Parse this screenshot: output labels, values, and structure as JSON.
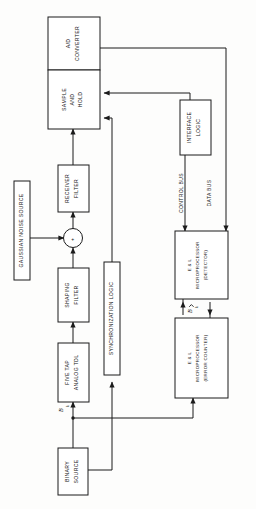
{
  "diagram": {
    "orientation": "rotated-90-ccw",
    "colors": {
      "stroke": "#1b1b1b",
      "background": "#fdfdfc",
      "block_fill": "#ffffff"
    },
    "blocks": [
      {
        "id": "ad_converter",
        "label": "A/D\nCONVERTER"
      },
      {
        "id": "sample_and_hold",
        "label": "SAMPLE\nAND\nHOLD"
      },
      {
        "id": "receiver_filter",
        "label": "RECEIVER\nFILTER"
      },
      {
        "id": "gaussian_noise",
        "label": "GAUSSIAN NOISE SOURCE"
      },
      {
        "id": "shaping_filter",
        "label": "SHAPING\nFILTER"
      },
      {
        "id": "five_tap_tdl",
        "label": "FIVE TAP\nANALOG TDL"
      },
      {
        "id": "sync_logic",
        "label": "SYNCHRONIZATION LOGIC"
      },
      {
        "id": "binary_source",
        "label": "BINARY\nSOURCE"
      },
      {
        "id": "interface_logic",
        "label": "INTERFACE\nLOGIC"
      },
      {
        "id": "micro_detector",
        "label": "E & L\nMICROPROCESSOR\n(DETECTOR)"
      },
      {
        "id": "micro_error_counter",
        "label": "E & L\nMICROPROCESSOR\n(ERROR COUNTER)"
      }
    ],
    "block_lines": {
      "ad_converter": [
        "A/D",
        "CONVERTER"
      ],
      "sample_and_hold": [
        "SAMPLE",
        "AND",
        "HOLD"
      ],
      "receiver_filter": [
        "RECEIVER",
        "FILTER"
      ],
      "gaussian_noise": [
        "GAUSSIAN NOISE SOURCE"
      ],
      "shaping_filter": [
        "SHAPING",
        "FILTER"
      ],
      "five_tap_tdl": [
        "FIVE TAP",
        "ANALOG TDL"
      ],
      "sync_logic": [
        "SYNCHRONIZATION LOGIC"
      ],
      "binary_source": [
        "BINARY",
        "SOURCE"
      ],
      "interface_logic": [
        "INTERFACE",
        "LOGIC"
      ],
      "micro_detector": [
        "E & L",
        "MICROPROCESSOR",
        "(DETECTOR)"
      ],
      "micro_error_counter": [
        "E & L",
        "MICROPROCESSOR",
        "(ERROR COUNTER)"
      ]
    },
    "bus_labels": [
      {
        "id": "control_bus",
        "label": "CONTROL BUS"
      },
      {
        "id": "data_bus",
        "label": "DATA BUS"
      }
    ],
    "signal_labels": [
      {
        "id": "b_k",
        "base": "B",
        "subscript": "k",
        "hat": false
      },
      {
        "id": "b_hat_k",
        "base": "B",
        "subscript": "k",
        "hat": true
      }
    ],
    "summing_junction": {
      "id": "summing-junction",
      "symbol": "+"
    }
  }
}
